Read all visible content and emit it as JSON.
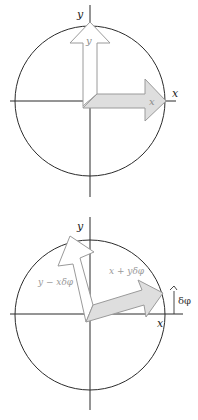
{
  "top_diagram": {
    "axis_labels": {
      "x": "x",
      "y": "y"
    },
    "arrow_labels": {
      "x": "x",
      "y": "y"
    }
  },
  "bottom_diagram": {
    "axis_labels": {
      "x": "x",
      "y": "y"
    },
    "arrow_labels": {
      "x": "x + yδφ",
      "y": "y − xδφ"
    },
    "angle_label": "δφ"
  },
  "colors": {
    "axis": "#2b2b2b",
    "y_arrow_fill": "#ffffff",
    "x_arrow_fill": "#dedede",
    "arrow_outline": "#9a9a9a"
  }
}
